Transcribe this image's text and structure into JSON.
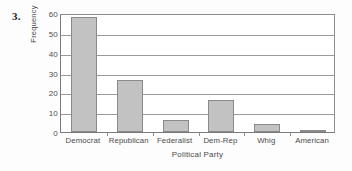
{
  "problem": {
    "number": "3."
  },
  "chart_data": {
    "type": "bar",
    "title": "",
    "xlabel": "Political Party",
    "ylabel": "Frequency",
    "categories": [
      "Democrat",
      "Republican",
      "Federalist",
      "Dem-Rep",
      "Whig",
      "American"
    ],
    "values": [
      58,
      26,
      6,
      16,
      4,
      1
    ],
    "ylim": [
      0,
      60
    ],
    "yticks": [
      0,
      10,
      20,
      30,
      40,
      50,
      60
    ],
    "ytick_labels": [
      "0",
      "10",
      "20",
      "30",
      "40",
      "50",
      "60"
    ],
    "grid": "horizontal",
    "legend": "none",
    "bar_fill_color": "#c2c2c2",
    "bar_border_color": "#8a8a8a",
    "axis_color": "#8d8d8d"
  }
}
